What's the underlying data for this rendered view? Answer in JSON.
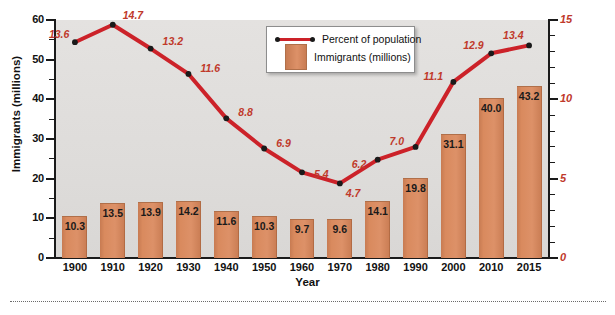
{
  "chart_data": {
    "type": "bar",
    "title": "",
    "categories": [
      "1900",
      "1910",
      "1920",
      "1930",
      "1940",
      "1950",
      "1960",
      "1970",
      "1980",
      "1990",
      "2000",
      "2010",
      "2015"
    ],
    "xlabel": "Year",
    "ylabel": "Immigrants (millions)",
    "ylim": [
      0,
      60
    ],
    "yticks": [
      0,
      10,
      20,
      30,
      40,
      50,
      60
    ],
    "y2label": "Immigrants as percentage of total population",
    "y2lim": [
      0,
      15
    ],
    "y2ticks": [
      0,
      5,
      10,
      15
    ],
    "grid": false,
    "legend_position": "top-center",
    "series": [
      {
        "name": "Immigrants (millions)",
        "type": "bar",
        "axis": "left",
        "color": "#d4835a",
        "values": [
          10.3,
          13.5,
          13.9,
          14.2,
          11.6,
          10.3,
          9.7,
          9.6,
          14.1,
          19.8,
          31.1,
          40.0,
          43.2
        ],
        "labels": [
          "10.3",
          "13.5",
          "13.9",
          "14.2",
          "11.6",
          "10.3",
          "9.7",
          "9.6",
          "14.1",
          "19.8",
          "31.1",
          "40.0",
          "43.2"
        ]
      },
      {
        "name": "Percent of population",
        "type": "line",
        "axis": "right",
        "color": "#cc2229",
        "values": [
          13.6,
          14.7,
          13.2,
          11.6,
          8.8,
          6.9,
          5.4,
          4.7,
          6.2,
          7.0,
          11.1,
          12.9,
          13.4
        ],
        "labels": [
          "13.6",
          "14.7",
          "13.2",
          "11.6",
          "8.8",
          "6.9",
          "5.4",
          "4.7",
          "6.2",
          "7.0",
          "11.1",
          "12.9",
          "13.4"
        ]
      }
    ]
  },
  "legend": {
    "items": [
      {
        "label": "Percent of population",
        "marker": "line"
      },
      {
        "label": "Immigrants (millions)",
        "marker": "swatch"
      }
    ]
  },
  "colors": {
    "bar": "#d4835a",
    "line": "#cc2229",
    "right_axis_text": "#cc2229",
    "plot_background": "#e0dedc",
    "axis": "#1a1a1a"
  },
  "footer": {
    "note": ""
  }
}
